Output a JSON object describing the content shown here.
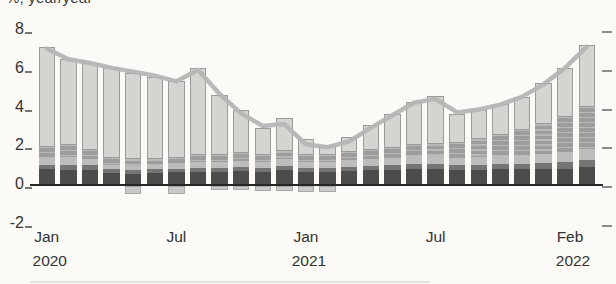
{
  "header": {
    "unit_label": "%, year/year"
  },
  "colors": {
    "background": "#fbfaf7",
    "axis": "#262626",
    "text": "#333333",
    "line": "#b5b5b5",
    "dark": "#4c4c4c",
    "mdark": "#757575",
    "lband": "#bdbdbd",
    "med": "#9d9d9d",
    "light": "#d6d4d0",
    "neg": "#c9c9c9"
  },
  "chart_data": {
    "type": "bar",
    "stacked": true,
    "title": "",
    "ylabel": "%, year/year",
    "xlabel": "",
    "ylim": [
      -2,
      8
    ],
    "yticks": [
      8,
      6,
      4,
      2,
      0,
      -2
    ],
    "grid": false,
    "legend": "none",
    "x": [
      "Jan 2020",
      "Feb 2020",
      "Mar 2020",
      "Apr 2020",
      "May 2020",
      "Jun 2020",
      "Jul 2020",
      "Aug 2020",
      "Sep 2020",
      "Oct 2020",
      "Nov 2020",
      "Dec 2020",
      "Jan 2021",
      "Feb 2021",
      "Mar 2021",
      "Apr 2021",
      "May 2021",
      "Jun 2021",
      "Jul 2021",
      "Aug 2021",
      "Sep 2021",
      "Oct 2021",
      "Nov 2021",
      "Dec 2021",
      "Jan 2022",
      "Feb 2022"
    ],
    "xticks": [
      {
        "index": 0,
        "month": "Jan",
        "year": "2020"
      },
      {
        "index": 6,
        "month": "Jul",
        "year": ""
      },
      {
        "index": 12,
        "month": "Jan",
        "year": "2021"
      },
      {
        "index": 18,
        "month": "Jul",
        "year": ""
      },
      {
        "index": 25,
        "month": "Feb",
        "year": "2022"
      }
    ],
    "series": [
      {
        "name": "component-dark-bottom",
        "key": "dark",
        "color": "#4c4c4c",
        "values": [
          0.75,
          0.7,
          0.7,
          0.55,
          0.5,
          0.55,
          0.6,
          0.6,
          0.6,
          0.65,
          0.6,
          0.7,
          0.6,
          0.6,
          0.65,
          0.7,
          0.7,
          0.75,
          0.75,
          0.7,
          0.7,
          0.75,
          0.75,
          0.8,
          0.8,
          0.9
        ]
      },
      {
        "name": "component-medium-dark",
        "key": "mdark",
        "color": "#757575",
        "values": [
          0.25,
          0.3,
          0.3,
          0.2,
          0.2,
          0.2,
          0.2,
          0.25,
          0.25,
          0.25,
          0.25,
          0.25,
          0.25,
          0.25,
          0.25,
          0.25,
          0.3,
          0.3,
          0.3,
          0.3,
          0.3,
          0.3,
          0.3,
          0.3,
          0.35,
          0.35
        ]
      },
      {
        "name": "component-light-band",
        "key": "lband",
        "color": "#bdbdbd",
        "values": [
          0.35,
          0.4,
          0.3,
          0.25,
          0.25,
          0.25,
          0.25,
          0.3,
          0.3,
          0.3,
          0.3,
          0.35,
          0.3,
          0.3,
          0.35,
          0.35,
          0.35,
          0.4,
          0.4,
          0.35,
          0.4,
          0.4,
          0.45,
          0.45,
          0.5,
          0.55
        ]
      },
      {
        "name": "component-medium",
        "key": "med",
        "color": "#9d9d9d",
        "values": [
          0.55,
          0.6,
          0.45,
          0.35,
          0.35,
          0.3,
          0.3,
          0.35,
          0.35,
          0.4,
          0.35,
          0.4,
          0.35,
          0.35,
          0.4,
          0.45,
          0.5,
          0.55,
          0.6,
          0.75,
          0.9,
          1.1,
          1.3,
          1.55,
          1.8,
          2.2
        ]
      },
      {
        "name": "component-light-top",
        "key": "light",
        "color": "#d6d4d0",
        "values": [
          5.2,
          4.45,
          4.5,
          4.65,
          4.45,
          4.25,
          3.95,
          4.5,
          3.1,
          2.2,
          1.4,
          1.7,
          0.8,
          0.5,
          0.8,
          1.3,
          1.75,
          2.25,
          2.5,
          1.5,
          1.5,
          1.6,
          1.7,
          2.1,
          2.55,
          3.2
        ]
      },
      {
        "name": "component-negative",
        "key": "neg",
        "color": "#c9c9c9",
        "values": [
          0,
          0,
          0,
          0,
          -0.4,
          0,
          -0.4,
          0,
          -0.2,
          -0.2,
          -0.25,
          -0.25,
          -0.3,
          -0.3,
          0,
          0,
          0,
          0,
          0,
          0,
          0,
          0,
          0,
          0,
          0,
          0
        ]
      }
    ],
    "line": {
      "name": "total-line",
      "color": "#b5b5b5",
      "values": [
        7.0,
        6.45,
        6.25,
        6.0,
        5.8,
        5.6,
        5.3,
        5.9,
        4.65,
        3.65,
        3.0,
        3.1,
        2.05,
        1.9,
        2.2,
        2.9,
        3.55,
        4.2,
        4.4,
        3.7,
        3.85,
        4.1,
        4.5,
        5.15,
        6.0,
        7.1
      ]
    }
  }
}
